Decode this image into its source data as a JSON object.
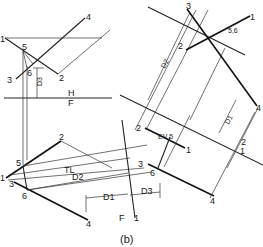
{
  "figure": {
    "caption": "(b)",
    "type": "descriptive-geometry-construction",
    "views": {
      "top": {
        "fold_line_labels": {
          "upper": "H",
          "lower": "F"
        },
        "points": [
          "1",
          "2",
          "3",
          "4",
          "5",
          "6"
        ],
        "dimension": "D3"
      },
      "front": {
        "points": [
          "1",
          "2",
          "3",
          "4",
          "5",
          "6"
        ],
        "true_length_label": "TL",
        "dimensions": [
          "D2",
          "D1"
        ],
        "fold_line_labels": {
          "left": "F",
          "right": "1"
        }
      },
      "auxiliary_1": {
        "points": [
          "1",
          "2",
          "3",
          "4",
          "6"
        ],
        "edge_view_label": "EV",
        "point_label": "5",
        "dimension": "D3",
        "fold_line_labels": {
          "upper": "2",
          "lower": "1"
        },
        "dimension_right": "D1"
      },
      "auxiliary_2": {
        "points": [
          "1",
          "2",
          "3",
          "4"
        ],
        "combined_point_label": "5,6",
        "dimension": "D2"
      }
    }
  }
}
